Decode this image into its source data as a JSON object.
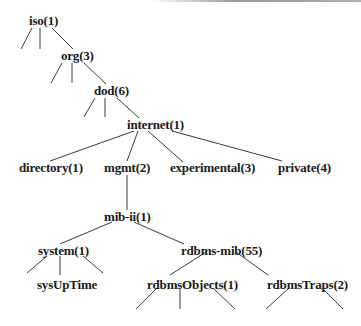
{
  "diagram": {
    "type": "tree",
    "nodes": [
      {
        "id": "iso",
        "label": "iso(1)",
        "x": 29,
        "y": 14
      },
      {
        "id": "org",
        "label": "org(3)",
        "x": 61,
        "y": 49
      },
      {
        "id": "dod",
        "label": "dod(6)",
        "x": 94,
        "y": 84
      },
      {
        "id": "internet",
        "label": "internet(1)",
        "x": 127,
        "y": 118
      },
      {
        "id": "directory",
        "label": "directory(1)",
        "x": 19,
        "y": 161
      },
      {
        "id": "mgmt",
        "label": "mgmt(2)",
        "x": 104,
        "y": 161
      },
      {
        "id": "experimental",
        "label": "experimental(3)",
        "x": 170,
        "y": 161
      },
      {
        "id": "private",
        "label": "private(4)",
        "x": 278,
        "y": 161
      },
      {
        "id": "mib-ii",
        "label": "mib-ii(1)",
        "x": 104,
        "y": 210
      },
      {
        "id": "system",
        "label": "system(1)",
        "x": 38,
        "y": 244
      },
      {
        "id": "rdbms-mib",
        "label": "rdbms-mib(55)",
        "x": 181,
        "y": 244
      },
      {
        "id": "sysUpTime",
        "label": "sysUpTime",
        "x": 37,
        "y": 278
      },
      {
        "id": "rdbmsObjects",
        "label": "rdbmsObjects(1)",
        "x": 147,
        "y": 278
      },
      {
        "id": "rdbmsTraps",
        "label": "rdbmsTraps(2)",
        "x": 267,
        "y": 278
      }
    ],
    "edges": [
      {
        "from": "iso",
        "to": "",
        "x1": 32,
        "y1": 28,
        "x2": 21,
        "y2": 49
      },
      {
        "from": "iso",
        "to": "",
        "x1": 40,
        "y1": 28,
        "x2": 40,
        "y2": 49
      },
      {
        "from": "iso",
        "to": "org",
        "x1": 52,
        "y1": 28,
        "x2": 73,
        "y2": 49
      },
      {
        "from": "org",
        "to": "",
        "x1": 62,
        "y1": 63,
        "x2": 51,
        "y2": 83
      },
      {
        "from": "org",
        "to": "",
        "x1": 72,
        "y1": 63,
        "x2": 72,
        "y2": 83
      },
      {
        "from": "org",
        "to": "dod",
        "x1": 84,
        "y1": 63,
        "x2": 106,
        "y2": 84
      },
      {
        "from": "dod",
        "to": "",
        "x1": 95,
        "y1": 98,
        "x2": 84,
        "y2": 117
      },
      {
        "from": "dod",
        "to": "",
        "x1": 105,
        "y1": 98,
        "x2": 105,
        "y2": 117
      },
      {
        "from": "dod",
        "to": "internet",
        "x1": 117,
        "y1": 98,
        "x2": 139,
        "y2": 118
      },
      {
        "from": "internet",
        "to": "directory",
        "x1": 134,
        "y1": 131,
        "x2": 50,
        "y2": 161
      },
      {
        "from": "internet",
        "to": "mgmt",
        "x1": 138,
        "y1": 131,
        "x2": 127,
        "y2": 161
      },
      {
        "from": "internet",
        "to": "experimental",
        "x1": 148,
        "y1": 131,
        "x2": 183,
        "y2": 162
      },
      {
        "from": "internet",
        "to": "private",
        "x1": 172,
        "y1": 131,
        "x2": 282,
        "y2": 161
      },
      {
        "from": "mgmt",
        "to": "mib-ii",
        "x1": 127,
        "y1": 175,
        "x2": 127,
        "y2": 210
      },
      {
        "from": "mib-ii",
        "to": "system",
        "x1": 112,
        "y1": 222,
        "x2": 60,
        "y2": 244
      },
      {
        "from": "mib-ii",
        "to": "rdbms-mib",
        "x1": 134,
        "y1": 222,
        "x2": 184,
        "y2": 244
      },
      {
        "from": "system",
        "to": "",
        "x1": 47,
        "y1": 256,
        "x2": 27,
        "y2": 273
      },
      {
        "from": "system",
        "to": "sysUpTime",
        "x1": 60,
        "y1": 256,
        "x2": 60,
        "y2": 275
      },
      {
        "from": "system",
        "to": "",
        "x1": 83,
        "y1": 256,
        "x2": 103,
        "y2": 273
      },
      {
        "from": "rdbms-mib",
        "to": "rdbmsObjects",
        "x1": 206,
        "y1": 252,
        "x2": 170,
        "y2": 275
      },
      {
        "from": "rdbms-mib",
        "to": "rdbmsTraps",
        "x1": 236,
        "y1": 252,
        "x2": 268,
        "y2": 275
      },
      {
        "from": "rdbmsObjects",
        "to": "",
        "x1": 157,
        "y1": 288,
        "x2": 136,
        "y2": 309
      },
      {
        "from": "rdbmsObjects",
        "to": "",
        "x1": 180,
        "y1": 288,
        "x2": 180,
        "y2": 309
      },
      {
        "from": "rdbmsObjects",
        "to": "",
        "x1": 213,
        "y1": 288,
        "x2": 235,
        "y2": 309
      },
      {
        "from": "rdbmsTraps",
        "to": "",
        "x1": 289,
        "y1": 288,
        "x2": 266,
        "y2": 309
      },
      {
        "from": "rdbmsTraps",
        "to": "",
        "x1": 322,
        "y1": 288,
        "x2": 343,
        "y2": 309
      }
    ]
  }
}
